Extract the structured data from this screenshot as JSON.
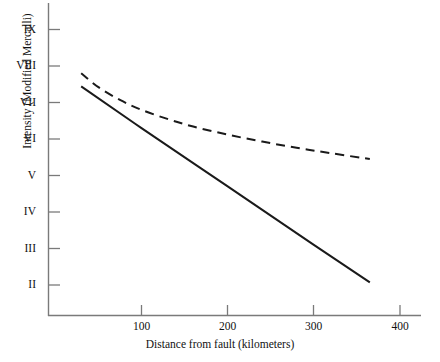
{
  "chart_data": {
    "type": "line",
    "title": "",
    "xlabel": "Distance from fault (kilometers)",
    "ylabel": "Intensity (Modified Mercalli)",
    "xlim": [
      28,
      420
    ],
    "ylim": [
      1.45,
      9.6
    ],
    "grid": false,
    "legend": "none",
    "x_ticks": [
      {
        "value": 100,
        "label": "100"
      },
      {
        "value": 200,
        "label": "200"
      },
      {
        "value": 300,
        "label": "300"
      },
      {
        "value": 400,
        "label": "400"
      }
    ],
    "y_ticks": [
      {
        "value": 9,
        "label": "IX"
      },
      {
        "value": 8,
        "label": "VIII"
      },
      {
        "value": 7,
        "label": "VII"
      },
      {
        "value": 6,
        "label": "VI"
      },
      {
        "value": 5,
        "label": "V"
      },
      {
        "value": 4,
        "label": "IV"
      },
      {
        "value": 3,
        "label": "III"
      },
      {
        "value": 2,
        "label": "II"
      }
    ],
    "series": [
      {
        "name": "upper-attenuation-curve",
        "style": "dashed",
        "color": "#1a1a1a",
        "points": [
          {
            "x": 30,
            "y": 7.8
          },
          {
            "x": 50,
            "y": 7.42
          },
          {
            "x": 75,
            "y": 7.07
          },
          {
            "x": 100,
            "y": 6.8
          },
          {
            "x": 130,
            "y": 6.55
          },
          {
            "x": 160,
            "y": 6.34
          },
          {
            "x": 200,
            "y": 6.12
          },
          {
            "x": 240,
            "y": 5.93
          },
          {
            "x": 280,
            "y": 5.76
          },
          {
            "x": 320,
            "y": 5.61
          },
          {
            "x": 365,
            "y": 5.45
          }
        ]
      },
      {
        "name": "lower-attenuation-curve",
        "style": "solid",
        "color": "#1a1a1a",
        "points": [
          {
            "x": 30,
            "y": 7.44
          },
          {
            "x": 100,
            "y": 6.3
          },
          {
            "x": 200,
            "y": 4.7
          },
          {
            "x": 300,
            "y": 3.1
          },
          {
            "x": 365,
            "y": 2.07
          }
        ]
      }
    ]
  },
  "axes": {
    "x_title": "Distance from fault (kilometers)",
    "y_title": "Intensity (Modified Mercalli)"
  },
  "colors": {
    "axis": "#777777",
    "line": "#1a1a1a",
    "background": "#ffffff",
    "text": "#111111"
  }
}
